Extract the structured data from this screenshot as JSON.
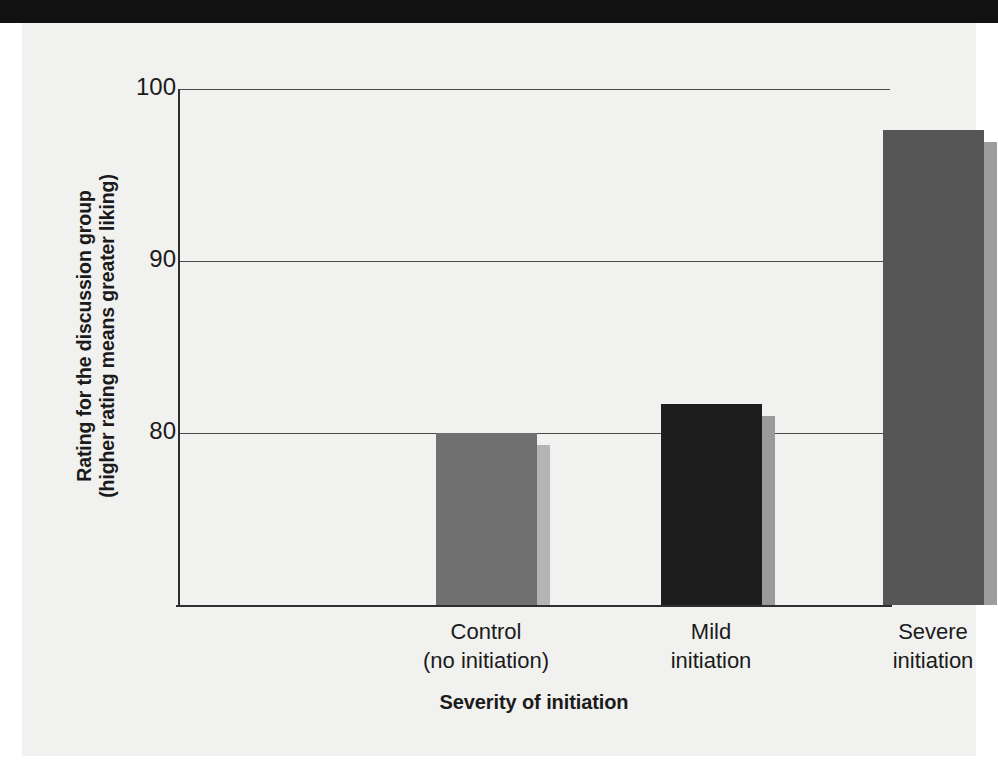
{
  "chart_data": {
    "type": "bar",
    "title": "",
    "subtitle": "",
    "xlabel": "Severity of initiation",
    "ylabel": "Rating for the discussion group (higher rating means greater liking)",
    "ylabel_lines": [
      "Rating for the discussion group",
      "(higher rating means greater liking)"
    ],
    "categories": [
      "Control (no initiation)",
      "Mild initiation",
      "Severe initiation"
    ],
    "category_lines": [
      [
        "Control",
        "(no initiation)"
      ],
      [
        "Mild",
        "initiation"
      ],
      [
        "Severe",
        "initiation"
      ]
    ],
    "values": [
      80.0,
      81.7,
      97.6
    ],
    "ylim": [
      74,
      100
    ],
    "yticks": [
      80,
      90,
      100
    ],
    "ytick_labels": [
      "80",
      "90",
      "100"
    ],
    "grid": true,
    "legend": "none",
    "bar_colors": [
      "#6f6f6f",
      "#1d1d1d",
      "#555555"
    ],
    "bar_shadow_colors": [
      "#b4b4b4",
      "#9a9a9a",
      "#9d9d9d"
    ]
  },
  "axis": {
    "y_tick_100": "100",
    "y_tick_90": "90",
    "y_tick_80": "80",
    "x_title": "Severity of initiation"
  },
  "colors": {
    "page_background": "#ffffff",
    "panel_background": "#f1f1ef",
    "top_bar": "#111111",
    "axis_line": "#2e2e2e",
    "gridline": "#4a4a4a",
    "text": "#1b1b1b"
  }
}
